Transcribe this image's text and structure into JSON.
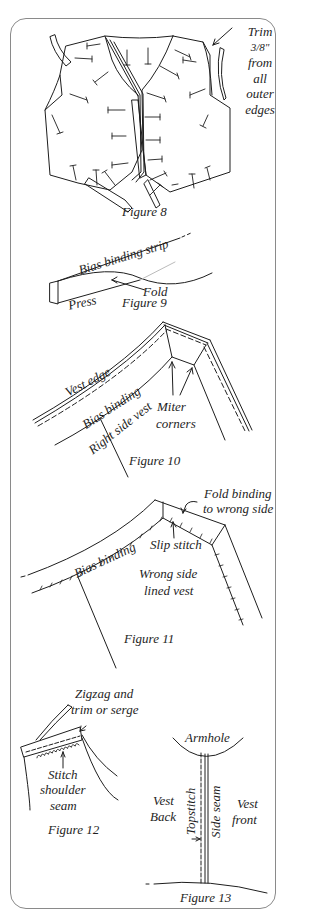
{
  "figures": [
    {
      "id": "figure-8",
      "caption": "Figure 8",
      "labels": {
        "trim_l1": "Trim",
        "trim_l2": "3/8\"",
        "trim_l3": "from",
        "trim_l4": "all",
        "trim_l5": "outer",
        "trim_l6": "edges"
      }
    },
    {
      "id": "figure-9",
      "caption": "Figure 9",
      "labels": {
        "strip": "Bias binding strip",
        "fold": "Fold",
        "press": "Press"
      }
    },
    {
      "id": "figure-10",
      "caption": "Figure 10",
      "labels": {
        "vest_edge": "Vest edge",
        "bias_binding": "Bias binding",
        "right_side": "Right side vest",
        "miter": "Miter",
        "corners": "corners"
      }
    },
    {
      "id": "figure-11",
      "caption": "Figure 11",
      "labels": {
        "fold_l1": "Fold binding",
        "fold_l2": "to wrong side",
        "slip": "Slip stitch",
        "bias_binding": "Bias binding",
        "wrong_l1": "Wrong side",
        "wrong_l2": "lined vest"
      }
    },
    {
      "id": "figure-12",
      "caption": "Figure 12",
      "labels": {
        "zigzag_l1": "Zigzag and",
        "zigzag_l2": "trim or serge",
        "stitch_l1": "Stitch",
        "stitch_l2": "shoulder",
        "stitch_l3": "seam"
      }
    },
    {
      "id": "figure-13",
      "caption": "Figure 13",
      "labels": {
        "armhole": "Armhole",
        "vest_back_l1": "Vest",
        "vest_back_l2": "Back",
        "topstitch": "Topstitch",
        "side_seam": "Side seam",
        "vest_front_l1": "Vest",
        "vest_front_l2": "front"
      }
    }
  ],
  "colors": {
    "ink": "#1e1e1e",
    "frame": "#8a8a8a",
    "background": "#ffffff"
  }
}
